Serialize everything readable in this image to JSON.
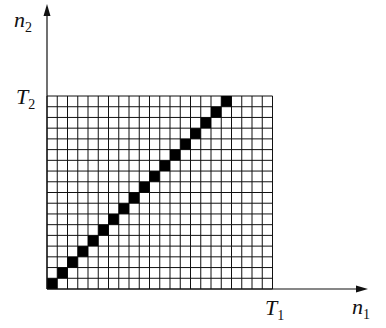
{
  "diagram": {
    "type": "grid-with-diagonal",
    "axes": {
      "x": {
        "label": "n",
        "subscript": "1"
      },
      "y": {
        "label": "n",
        "subscript": "2"
      }
    },
    "ticks": {
      "x": {
        "label": "T",
        "subscript": "1"
      },
      "y": {
        "label": "T",
        "subscript": "2"
      }
    },
    "grid": {
      "columns": 22,
      "rows": 18
    },
    "diagonal_cells": 18,
    "colors": {
      "line": "#111111",
      "fill": "#000000",
      "background": "#ffffff"
    }
  }
}
